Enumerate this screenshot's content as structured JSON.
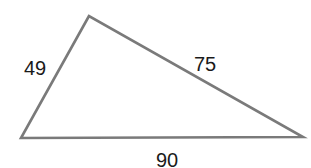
{
  "diagram": {
    "type": "triangle",
    "stroke_color": "#7a7a7a",
    "label_color": "#1a1a1a",
    "vertices": {
      "top": [
        89,
        16
      ],
      "bottom_left": [
        21,
        138
      ],
      "bottom_right": [
        303,
        137
      ]
    },
    "sides": [
      {
        "name": "left",
        "label": "49"
      },
      {
        "name": "right",
        "label": "75"
      },
      {
        "name": "bottom",
        "label": "90"
      }
    ]
  }
}
